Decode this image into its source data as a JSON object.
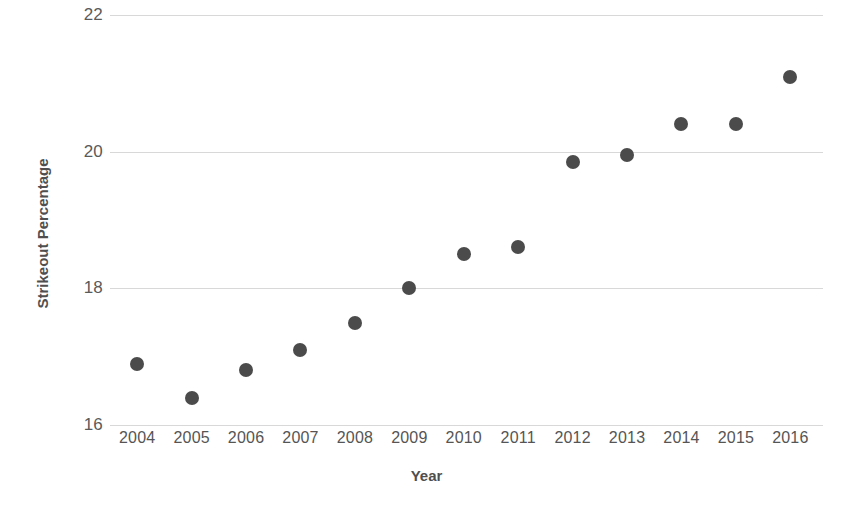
{
  "chart_data": {
    "type": "scatter",
    "title": "",
    "xlabel": "Year",
    "ylabel": "Strikeout Percentage",
    "x": [
      2004,
      2005,
      2006,
      2007,
      2008,
      2009,
      2010,
      2011,
      2012,
      2013,
      2014,
      2015,
      2016
    ],
    "values": [
      16.9,
      16.4,
      16.8,
      17.1,
      17.5,
      18.0,
      18.5,
      18.6,
      19.85,
      19.95,
      20.4,
      20.4,
      21.1
    ],
    "categories": [
      "2004",
      "2005",
      "2006",
      "2007",
      "2008",
      "2009",
      "2010",
      "2011",
      "2012",
      "2013",
      "2014",
      "2015",
      "2016"
    ],
    "xtick_labels": [
      "2004",
      "2005",
      "2006",
      "2007",
      "2008",
      "2009",
      "2010",
      "2011",
      "2012",
      "2013",
      "2014",
      "2015",
      "2016"
    ],
    "ytick_labels": [
      "22",
      "20",
      "18",
      "16"
    ],
    "yticks": [
      22,
      20,
      18,
      16
    ],
    "ylim": [
      16,
      22
    ],
    "xlim": [
      2003.5,
      2016.6
    ],
    "grid": "horizontal",
    "legend": "none",
    "marker_color": "#4b4b4b",
    "gridline_color": "#d8d8d8",
    "background_color": "#ffffff",
    "points": [
      {
        "label": "2004",
        "x": 2004,
        "y": 16.9
      },
      {
        "label": "2005",
        "x": 2005,
        "y": 16.4
      },
      {
        "label": "2006",
        "x": 2006,
        "y": 16.8
      },
      {
        "label": "2007",
        "x": 2007,
        "y": 17.1
      },
      {
        "label": "2008",
        "x": 2008,
        "y": 17.5
      },
      {
        "label": "2009",
        "x": 2009,
        "y": 18.0
      },
      {
        "label": "2010",
        "x": 2010,
        "y": 18.5
      },
      {
        "label": "2011",
        "x": 2011,
        "y": 18.6
      },
      {
        "label": "2012",
        "x": 2012,
        "y": 19.85
      },
      {
        "label": "2013",
        "x": 2013,
        "y": 19.95
      },
      {
        "label": "2014",
        "x": 2014,
        "y": 20.4
      },
      {
        "label": "2015",
        "x": 2015,
        "y": 20.4
      },
      {
        "label": "2016",
        "x": 2016,
        "y": 21.1
      }
    ]
  }
}
